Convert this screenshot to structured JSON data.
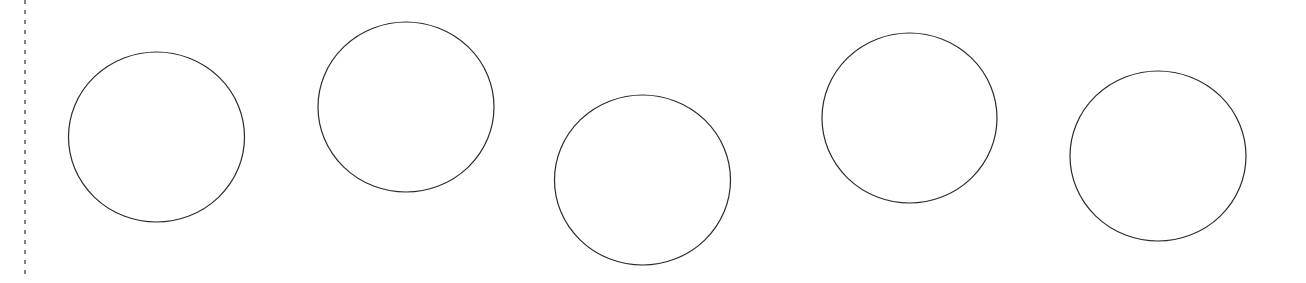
{
  "canvas": {
    "width": 1306,
    "height": 283,
    "background": "#ffffff"
  },
  "divider": {
    "x": 25,
    "y1": 0,
    "y2": 280,
    "stroke": "#333333",
    "stroke_width": 1.2,
    "dash": "4 6"
  },
  "circles": [
    {
      "id": "circle-1",
      "cx": 156.5,
      "cy": 137,
      "rx": 88,
      "ry": 85,
      "stroke": "#2b2b2b",
      "stroke_width": 1.2,
      "fill": "none"
    },
    {
      "id": "circle-2",
      "cx": 406,
      "cy": 107,
      "rx": 88,
      "ry": 85,
      "stroke": "#2b2b2b",
      "stroke_width": 1.2,
      "fill": "none"
    },
    {
      "id": "circle-3",
      "cx": 642.5,
      "cy": 180,
      "rx": 88,
      "ry": 85,
      "stroke": "#2b2b2b",
      "stroke_width": 1.2,
      "fill": "none"
    },
    {
      "id": "circle-4",
      "cx": 909.5,
      "cy": 118,
      "rx": 87.5,
      "ry": 85,
      "stroke": "#2b2b2b",
      "stroke_width": 1.2,
      "fill": "none"
    },
    {
      "id": "circle-5",
      "cx": 1158,
      "cy": 156,
      "rx": 88,
      "ry": 85,
      "stroke": "#2b2b2b",
      "stroke_width": 1.2,
      "fill": "none"
    }
  ]
}
